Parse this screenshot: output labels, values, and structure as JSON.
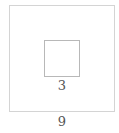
{
  "diagram": {
    "outer_square": {
      "side_label": "9"
    },
    "inner_square": {
      "side_label": "3"
    },
    "colors": {
      "outer_stroke": "#d4d4d4",
      "inner_stroke": "#b8b8b8",
      "text": "#555555"
    }
  }
}
